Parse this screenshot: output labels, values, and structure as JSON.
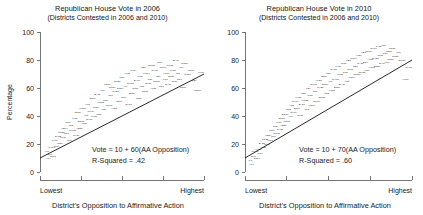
{
  "figure": {
    "background_color": "#ffffff",
    "text_color": "#1a1a1a",
    "line_color": "#111111"
  },
  "chart_data": [
    {
      "type": "scatter",
      "panel": "left",
      "title": "Republican House Vote in 2006",
      "subtitle": "(Districts Contested in 2006 and 2010)",
      "xlabel": "District's Opposition to Affirmative Action",
      "ylabel": "Percentage",
      "ylim": [
        0,
        100
      ],
      "yticks": [
        0,
        20,
        40,
        60,
        80,
        100
      ],
      "yticklabels": [
        "0",
        "20",
        "40",
        "60",
        "80",
        "100"
      ],
      "xlim": [
        0,
        1
      ],
      "xticks": [
        0,
        0.25,
        0.5,
        0.75,
        1
      ],
      "xticklabels": [
        "Lowest",
        "",
        "",
        "",
        "Highest"
      ],
      "x_end_labels": [
        "Lowest",
        "Highest"
      ],
      "grid": false,
      "legend": false,
      "marker_style": "district-code-text",
      "annotations": [
        "Vote = 10 + 60(AA Opposition)",
        "R-Squared = .42"
      ],
      "fit": {
        "equation": "Vote = 10 + 60(AA Opposition)",
        "intercept": 10,
        "slope": 60,
        "r_squared": 0.42,
        "r_squared_label": "R-Squared = .42"
      },
      "points": [
        [
          0.04,
          14
        ],
        [
          0.05,
          9
        ],
        [
          0.06,
          12
        ],
        [
          0.07,
          17
        ],
        [
          0.08,
          11
        ],
        [
          0.09,
          22
        ],
        [
          0.1,
          18
        ],
        [
          0.11,
          25
        ],
        [
          0.12,
          20
        ],
        [
          0.13,
          28
        ],
        [
          0.14,
          24
        ],
        [
          0.15,
          31
        ],
        [
          0.16,
          27
        ],
        [
          0.17,
          35
        ],
        [
          0.18,
          22
        ],
        [
          0.19,
          33
        ],
        [
          0.2,
          29
        ],
        [
          0.21,
          38
        ],
        [
          0.22,
          26
        ],
        [
          0.23,
          42
        ],
        [
          0.24,
          31
        ],
        [
          0.25,
          36
        ],
        [
          0.26,
          45
        ],
        [
          0.27,
          34
        ],
        [
          0.28,
          40
        ],
        [
          0.29,
          48
        ],
        [
          0.3,
          37
        ],
        [
          0.31,
          43
        ],
        [
          0.32,
          52
        ],
        [
          0.33,
          39
        ],
        [
          0.34,
          46
        ],
        [
          0.35,
          55
        ],
        [
          0.36,
          41
        ],
        [
          0.37,
          49
        ],
        [
          0.38,
          58
        ],
        [
          0.39,
          44
        ],
        [
          0.4,
          51
        ],
        [
          0.41,
          62
        ],
        [
          0.42,
          47
        ],
        [
          0.43,
          54
        ],
        [
          0.44,
          60
        ],
        [
          0.45,
          45
        ],
        [
          0.46,
          57
        ],
        [
          0.47,
          64
        ],
        [
          0.48,
          50
        ],
        [
          0.49,
          59
        ],
        [
          0.5,
          67
        ],
        [
          0.51,
          53
        ],
        [
          0.52,
          61
        ],
        [
          0.53,
          70
        ],
        [
          0.54,
          48
        ],
        [
          0.55,
          63
        ],
        [
          0.56,
          56
        ],
        [
          0.57,
          72
        ],
        [
          0.58,
          59
        ],
        [
          0.59,
          65
        ],
        [
          0.6,
          52
        ],
        [
          0.61,
          68
        ],
        [
          0.62,
          61
        ],
        [
          0.63,
          74
        ],
        [
          0.64,
          57
        ],
        [
          0.65,
          70
        ],
        [
          0.66,
          63
        ],
        [
          0.67,
          66
        ],
        [
          0.68,
          76
        ],
        [
          0.69,
          59
        ],
        [
          0.7,
          72
        ],
        [
          0.71,
          64
        ],
        [
          0.72,
          68
        ],
        [
          0.73,
          78
        ],
        [
          0.74,
          61
        ],
        [
          0.75,
          74
        ],
        [
          0.76,
          66
        ],
        [
          0.77,
          70
        ],
        [
          0.78,
          62
        ],
        [
          0.79,
          76
        ],
        [
          0.8,
          68
        ],
        [
          0.81,
          72
        ],
        [
          0.82,
          64
        ],
        [
          0.83,
          79
        ],
        [
          0.84,
          70
        ],
        [
          0.85,
          66
        ],
        [
          0.86,
          74
        ],
        [
          0.87,
          60
        ],
        [
          0.88,
          77
        ],
        [
          0.9,
          69
        ],
        [
          0.92,
          72
        ],
        [
          0.94,
          65
        ],
        [
          0.96,
          58
        ],
        [
          0.98,
          71
        ]
      ]
    },
    {
      "type": "scatter",
      "panel": "right",
      "title": "Republican House Vote in 2010",
      "subtitle": "(Districts Contested in 2006 and 2010)",
      "xlabel": "District's Opposition to Affirmative Action",
      "ylabel": "",
      "ylim": [
        0,
        100
      ],
      "yticks": [
        0,
        20,
        40,
        60,
        80,
        100
      ],
      "yticklabels": [
        "0",
        "20",
        "40",
        "60",
        "80",
        "100"
      ],
      "xlim": [
        0,
        1
      ],
      "xticks": [
        0,
        0.25,
        0.5,
        0.75,
        1
      ],
      "xticklabels": [
        "Lowest",
        "",
        "",
        "",
        "Highest"
      ],
      "x_end_labels": [
        "Lowest",
        "Highest"
      ],
      "grid": false,
      "legend": false,
      "marker_style": "district-code-text",
      "annotations": [
        "Vote = 10 + 70(AA Opposition)",
        "R-Squared = .60"
      ],
      "fit": {
        "equation": "Vote = 10 + 70(AA Opposition)",
        "intercept": 10,
        "slope": 70,
        "r_squared": 0.6,
        "r_squared_label": "R-Squared = .60"
      },
      "points": [
        [
          0.03,
          8
        ],
        [
          0.04,
          5
        ],
        [
          0.05,
          11
        ],
        [
          0.06,
          14
        ],
        [
          0.07,
          9
        ],
        [
          0.08,
          16
        ],
        [
          0.09,
          13
        ],
        [
          0.1,
          20
        ],
        [
          0.11,
          17
        ],
        [
          0.12,
          23
        ],
        [
          0.13,
          19
        ],
        [
          0.14,
          26
        ],
        [
          0.15,
          22
        ],
        [
          0.16,
          29
        ],
        [
          0.17,
          25
        ],
        [
          0.18,
          32
        ],
        [
          0.19,
          27
        ],
        [
          0.2,
          35
        ],
        [
          0.21,
          30
        ],
        [
          0.22,
          38
        ],
        [
          0.23,
          33
        ],
        [
          0.24,
          41
        ],
        [
          0.25,
          36
        ],
        [
          0.26,
          44
        ],
        [
          0.27,
          39
        ],
        [
          0.28,
          47
        ],
        [
          0.29,
          42
        ],
        [
          0.3,
          50
        ],
        [
          0.31,
          45
        ],
        [
          0.32,
          53
        ],
        [
          0.33,
          40
        ],
        [
          0.34,
          48
        ],
        [
          0.35,
          56
        ],
        [
          0.36,
          51
        ],
        [
          0.37,
          44
        ],
        [
          0.38,
          59
        ],
        [
          0.39,
          54
        ],
        [
          0.4,
          47
        ],
        [
          0.41,
          62
        ],
        [
          0.42,
          57
        ],
        [
          0.43,
          50
        ],
        [
          0.44,
          65
        ],
        [
          0.45,
          60
        ],
        [
          0.46,
          53
        ],
        [
          0.47,
          68
        ],
        [
          0.48,
          62
        ],
        [
          0.49,
          56
        ],
        [
          0.5,
          70
        ],
        [
          0.51,
          64
        ],
        [
          0.52,
          58
        ],
        [
          0.53,
          73
        ],
        [
          0.54,
          66
        ],
        [
          0.55,
          60
        ],
        [
          0.56,
          75
        ],
        [
          0.57,
          69
        ],
        [
          0.58,
          62
        ],
        [
          0.59,
          77
        ],
        [
          0.6,
          71
        ],
        [
          0.61,
          64
        ],
        [
          0.62,
          79
        ],
        [
          0.63,
          73
        ],
        [
          0.64,
          67
        ],
        [
          0.65,
          81
        ],
        [
          0.66,
          75
        ],
        [
          0.67,
          69
        ],
        [
          0.68,
          83
        ],
        [
          0.69,
          77
        ],
        [
          0.7,
          71
        ],
        [
          0.71,
          85
        ],
        [
          0.72,
          78
        ],
        [
          0.73,
          72
        ],
        [
          0.74,
          86
        ],
        [
          0.75,
          80
        ],
        [
          0.76,
          74
        ],
        [
          0.77,
          88
        ],
        [
          0.78,
          81
        ],
        [
          0.79,
          75
        ],
        [
          0.8,
          89
        ],
        [
          0.81,
          83
        ],
        [
          0.82,
          77
        ],
        [
          0.83,
          90
        ],
        [
          0.84,
          84
        ],
        [
          0.85,
          78
        ],
        [
          0.86,
          86
        ],
        [
          0.87,
          80
        ],
        [
          0.88,
          88
        ],
        [
          0.9,
          82
        ],
        [
          0.92,
          85
        ],
        [
          0.94,
          79
        ],
        [
          0.96,
          66
        ],
        [
          0.98,
          74
        ]
      ]
    }
  ]
}
